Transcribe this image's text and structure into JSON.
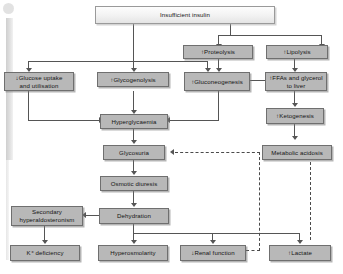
{
  "diagram": {
    "box_fill": "#b8b8b8",
    "box_border": "#6f6f6f",
    "line_color": "#555555",
    "nodes": {
      "insufficient_insulin": "Insufficient insulin",
      "proteolysis": "↑Proteolysis",
      "lipolysis": "↑Lipolysis",
      "glucose_uptake": "↓Glucose uptake and utilisation",
      "glycogenolysis": "↑Glycogenolysis",
      "gluconeogenesis": "↑Gluconeogenesis",
      "ffas_glycerol": "↑FFAs and glycerol to liver",
      "hyperglycaemia": "Hyperglycaemia",
      "ketogenesis": "↑Ketogenesis",
      "glycosuria": "Glycosuria",
      "metabolic_acidosis": "Metabolic acidosis",
      "osmotic_diuresis": "Osmotic diuresis",
      "secondary_hyperaldosteronism": "Secondary hyperaldosteronism",
      "dehydration": "Dehydration",
      "k_deficiency": "K⁺ deficiency",
      "hyperosmolarity": "Hyperosmolarity",
      "renal_function": "↓Renal function",
      "lactate": "↑Lactate"
    },
    "node_lines": {
      "glucose_uptake_l1": "↓Glucose uptake",
      "glucose_uptake_l2": "and utilisation",
      "ffas_glycerol_l1": "↑FFAs and glycerol",
      "ffas_glycerol_l2": "to liver",
      "secondary_hyper_l1": "Secondary",
      "secondary_hyper_l2": "hyperaldosteronism"
    },
    "edges": [
      {
        "from": "insufficient_insulin",
        "to": "glucose_uptake",
        "style": "solid"
      },
      {
        "from": "insufficient_insulin",
        "to": "glycogenolysis",
        "style": "solid"
      },
      {
        "from": "insufficient_insulin",
        "to": "gluconeogenesis",
        "style": "solid"
      },
      {
        "from": "insufficient_insulin",
        "to": "proteolysis",
        "style": "solid"
      },
      {
        "from": "insufficient_insulin",
        "to": "lipolysis",
        "style": "solid"
      },
      {
        "from": "proteolysis",
        "to": "gluconeogenesis",
        "style": "solid"
      },
      {
        "from": "lipolysis",
        "to": "ffas_glycerol",
        "style": "solid"
      },
      {
        "from": "ffas_glycerol",
        "to": "gluconeogenesis",
        "style": "solid"
      },
      {
        "from": "ffas_glycerol",
        "to": "ketogenesis",
        "style": "solid"
      },
      {
        "from": "glucose_uptake",
        "to": "hyperglycaemia",
        "style": "solid"
      },
      {
        "from": "glycogenolysis",
        "to": "hyperglycaemia",
        "style": "solid"
      },
      {
        "from": "gluconeogenesis",
        "to": "hyperglycaemia",
        "style": "solid"
      },
      {
        "from": "ketogenesis",
        "to": "metabolic_acidosis",
        "style": "solid"
      },
      {
        "from": "hyperglycaemia",
        "to": "glycosuria",
        "style": "solid"
      },
      {
        "from": "glycosuria",
        "to": "osmotic_diuresis",
        "style": "solid"
      },
      {
        "from": "osmotic_diuresis",
        "to": "dehydration",
        "style": "solid"
      },
      {
        "from": "dehydration",
        "to": "secondary_hyperaldosteronism",
        "style": "solid"
      },
      {
        "from": "secondary_hyperaldosteronism",
        "to": "k_deficiency",
        "style": "solid"
      },
      {
        "from": "dehydration",
        "to": "hyperosmolarity",
        "style": "solid"
      },
      {
        "from": "dehydration",
        "to": "renal_function",
        "style": "solid"
      },
      {
        "from": "dehydration",
        "to": "lactate",
        "style": "solid"
      },
      {
        "from": "renal_function",
        "to": "glycosuria",
        "style": "dashed"
      },
      {
        "from": "lactate",
        "to": "metabolic_acidosis",
        "style": "dashed"
      }
    ]
  }
}
